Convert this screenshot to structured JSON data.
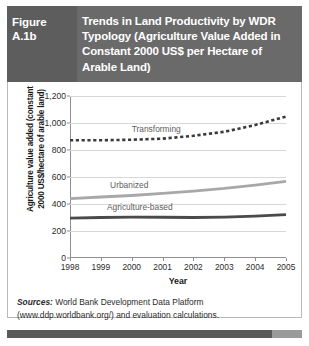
{
  "header": {
    "figure_number": "Figure A.1b",
    "title": "Trends in Land Productivity by WDR Typology (Agriculture Value Added in Constant 2000 US$ per Hectare of Arable Land)",
    "background_color": "#6a6a6a",
    "figno_background_color": "#5d5d5d",
    "text_color": "#ffffff"
  },
  "source": {
    "label": "Sources:",
    "text": " World Bank Development Data Platform (www.ddp.worldbank.org/) and evaluation calculations."
  },
  "chart_data": {
    "type": "line",
    "title": "",
    "xlabel": "Year",
    "ylabel": "Agriculture value added (constant 2000 US$/hectare of arable land)",
    "ylabel_line1": "Agriculture value added (constant",
    "ylabel_line2": "2000 US$/hectare of arable land)",
    "x": [
      1998,
      1999,
      2000,
      2001,
      2002,
      2003,
      2004,
      2005
    ],
    "categories": [
      "1998",
      "1999",
      "2000",
      "2001",
      "2002",
      "2003",
      "2004",
      "2005"
    ],
    "ylim": [
      0,
      1200
    ],
    "yticks": [
      0,
      200,
      400,
      600,
      800,
      1000,
      1200
    ],
    "ytick_labels": [
      "0",
      "200",
      "400",
      "600",
      "800",
      "1,000",
      "1,200"
    ],
    "grid": true,
    "grid_axis": "y",
    "legend": "inline-labels",
    "series": [
      {
        "name": "Transforming",
        "values": [
          872,
          872,
          876,
          884,
          905,
          935,
          985,
          1048
        ],
        "style": "dashed",
        "color": "#3a3a3a",
        "width": 2.6,
        "label_x": 2000.0,
        "label_y": 985
      },
      {
        "name": "Urbanized",
        "values": [
          440,
          452,
          463,
          478,
          495,
          515,
          540,
          568
        ],
        "style": "solid",
        "color": "#a8a8a8",
        "width": 2.8,
        "label_x": 1999.3,
        "label_y": 570
      },
      {
        "name": "Agriculture-based",
        "values": [
          295,
          300,
          303,
          302,
          300,
          303,
          310,
          322
        ],
        "style": "solid",
        "color": "#4a4a4a",
        "width": 2.8,
        "label_x": 1999.2,
        "label_y": 408
      }
    ]
  }
}
